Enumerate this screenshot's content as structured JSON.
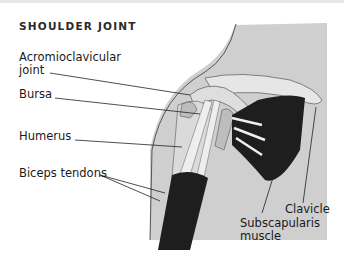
{
  "title": "SHOULDER JOINT",
  "labels": {
    "acromioclavicular": [
      "Acromioclavicular",
      "joint"
    ],
    "bursa": "Bursa",
    "humerus": "Humerus",
    "biceps_tendons": "Biceps tendons",
    "clavicle": "Clavicle",
    "subscapularis": [
      "Subscapularis",
      "muscle"
    ]
  },
  "colors": {
    "skin": "#c9c9c9",
    "background_panel": "#d4d4d4",
    "muscle_dark": "#1e1e1e",
    "bone": "#e2e2e2",
    "text": "#1a1a1a"
  }
}
